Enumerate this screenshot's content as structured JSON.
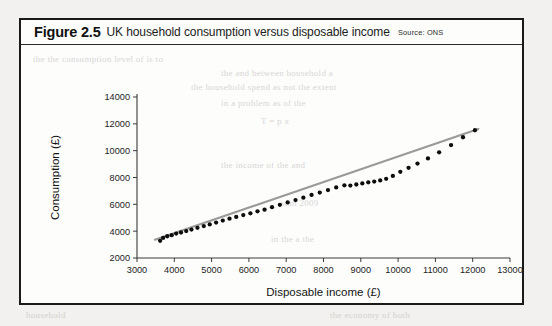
{
  "figure": {
    "number": "Figure 2.5",
    "caption": "UK household consumption versus disposable income",
    "source": "Source: ONS"
  },
  "chart_data": {
    "type": "scatter",
    "title": "UK household consumption versus disposable income",
    "xlabel": "Disposable income (£)",
    "ylabel": "Consumption (£)",
    "xlim": [
      3000,
      13000
    ],
    "ylim": [
      2000,
      14000
    ],
    "xticks": [
      3000,
      4000,
      5000,
      6000,
      7000,
      8000,
      9000,
      10000,
      11000,
      12000,
      13000
    ],
    "yticks": [
      2000,
      4000,
      6000,
      8000,
      10000,
      12000,
      14000
    ],
    "grid": false,
    "legend": false,
    "series": [
      {
        "name": "Households",
        "marker": "filled-circle",
        "color": "#0d0d0d",
        "points": [
          [
            3620,
            3280
          ],
          [
            3700,
            3500
          ],
          [
            3810,
            3620
          ],
          [
            3930,
            3700
          ],
          [
            4050,
            3820
          ],
          [
            4180,
            3900
          ],
          [
            4320,
            4010
          ],
          [
            4460,
            4120
          ],
          [
            4620,
            4250
          ],
          [
            4790,
            4380
          ],
          [
            4950,
            4500
          ],
          [
            5120,
            4640
          ],
          [
            5300,
            4790
          ],
          [
            5480,
            4930
          ],
          [
            5660,
            5060
          ],
          [
            5850,
            5200
          ],
          [
            6040,
            5330
          ],
          [
            6230,
            5480
          ],
          [
            6420,
            5600
          ],
          [
            6620,
            5790
          ],
          [
            6830,
            5960
          ],
          [
            7040,
            6140
          ],
          [
            7250,
            6320
          ],
          [
            7460,
            6500
          ],
          [
            7680,
            6700
          ],
          [
            7900,
            6880
          ],
          [
            8120,
            7060
          ],
          [
            8340,
            7260
          ],
          [
            8560,
            7420
          ],
          [
            8720,
            7400
          ],
          [
            8880,
            7480
          ],
          [
            9040,
            7560
          ],
          [
            9200,
            7640
          ],
          [
            9360,
            7700
          ],
          [
            9520,
            7780
          ],
          [
            9680,
            7900
          ],
          [
            9860,
            8120
          ],
          [
            10060,
            8420
          ],
          [
            10280,
            8720
          ],
          [
            10520,
            9040
          ],
          [
            10800,
            9420
          ],
          [
            11100,
            9880
          ],
          [
            11420,
            10420
          ],
          [
            11740,
            11000
          ],
          [
            12060,
            11520
          ]
        ]
      }
    ],
    "trend_line": {
      "name": "Line of best fit",
      "color": "#9a9a9a",
      "from": [
        3480,
        3360
      ],
      "to": [
        12150,
        11620
      ]
    }
  },
  "ghost_text": {
    "lines": [
      "and 2011 money and other factors. A connection by of fluctuations beyond of both economy",
      "of the the consumption level of the",
      "in shall income discovered",
      "as not the sum the extent",
      "and the the",
      "consumption",
      "gap the a",
      "household"
    ]
  }
}
